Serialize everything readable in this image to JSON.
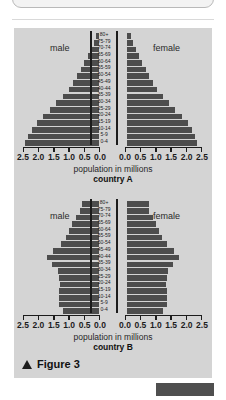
{
  "top_box": {
    "dots": "· ·"
  },
  "figure": {
    "caption_label": "Figure 3",
    "triangle_icon": "up-triangle-icon"
  },
  "axis": {
    "caption": "population in millions",
    "male_label": "male",
    "female_label": "female",
    "tick_labels_left": [
      "2.5",
      "2.0",
      "1.5",
      "1.0",
      "0.5",
      "0.0"
    ],
    "tick_labels_right": [
      "0.0",
      "0.5",
      "1.0",
      "1.5",
      "2.0",
      "2.5"
    ]
  },
  "colors": {
    "panel_bg": "#d4d4d4",
    "bar": "#4d4d4d",
    "axis": "#1c1c1c",
    "page_bg": "#ffffff",
    "bottom_block": "#4f4f4f"
  },
  "chart_data": [
    {
      "type": "bar",
      "title": "country A",
      "subtype": "population-pyramid",
      "xlabel": "population in millions",
      "ylabel": "",
      "xlim": [
        0,
        2.5
      ],
      "grid": false,
      "legend": [
        "male",
        "female"
      ],
      "categories": [
        "80+",
        "75-79",
        "70-74",
        "65-69",
        "60-64",
        "55-59",
        "50-54",
        "45-49",
        "40-44",
        "35-39",
        "30-34",
        "25-29",
        "20-24",
        "15-19",
        "10-14",
        "5-9",
        "0-4"
      ],
      "series": [
        {
          "name": "male",
          "values": [
            0.1,
            0.18,
            0.27,
            0.37,
            0.48,
            0.6,
            0.72,
            0.85,
            1.0,
            1.2,
            1.4,
            1.6,
            1.85,
            2.05,
            2.2,
            2.35,
            2.45
          ]
        },
        {
          "name": "female",
          "values": [
            0.12,
            0.2,
            0.3,
            0.4,
            0.5,
            0.62,
            0.74,
            0.87,
            1.0,
            1.18,
            1.38,
            1.58,
            1.8,
            2.0,
            2.15,
            2.25,
            2.3
          ]
        }
      ]
    },
    {
      "type": "bar",
      "title": "country B",
      "subtype": "population-pyramid",
      "xlabel": "population in millions",
      "ylabel": "",
      "xlim": [
        0,
        2.5
      ],
      "grid": false,
      "legend": [
        "male",
        "female"
      ],
      "categories": [
        "80+",
        "75-79",
        "70-74",
        "65-69",
        "60-64",
        "55-59",
        "50-54",
        "45-49",
        "40-44",
        "35-39",
        "30-34",
        "25-29",
        "20-24",
        "15-19",
        "10-14",
        "5-9",
        "0-4"
      ],
      "series": [
        {
          "name": "male",
          "values": [
            0.55,
            0.62,
            0.75,
            0.88,
            1.0,
            1.1,
            1.25,
            1.5,
            1.7,
            1.55,
            1.35,
            1.3,
            1.28,
            1.3,
            1.3,
            1.3,
            1.2
          ]
        },
        {
          "name": "female",
          "values": [
            0.72,
            0.72,
            0.85,
            0.95,
            1.05,
            1.15,
            1.3,
            1.55,
            1.7,
            1.5,
            1.35,
            1.3,
            1.28,
            1.3,
            1.3,
            1.3,
            1.2
          ]
        }
      ]
    }
  ]
}
